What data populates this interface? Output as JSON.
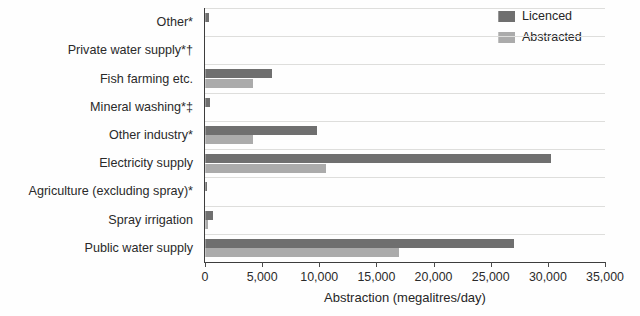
{
  "chart_data": {
    "type": "bar",
    "orientation": "horizontal",
    "title": "",
    "xlabel": "Abstraction (megalitres/day)",
    "ylabel": "",
    "xlim": [
      0,
      35000
    ],
    "xticks": [
      "0",
      "5,000",
      "10,000",
      "15,000",
      "20,000",
      "25,000",
      "30,000",
      "35,000"
    ],
    "xtick_values": [
      0,
      5000,
      10000,
      15000,
      20000,
      25000,
      30000,
      35000
    ],
    "grid": true,
    "legend_position": "top-right",
    "categories": [
      "Other*",
      "Private water supply*†",
      "Fish farming etc.",
      "Mineral washing*‡",
      "Other industry*",
      "Electricity supply",
      "Agriculture (excluding spray)*",
      "Spray irrigation",
      "Public water supply"
    ],
    "series": [
      {
        "name": "Licenced",
        "color": "#6f6f6f",
        "values": [
          350,
          0,
          5900,
          400,
          9800,
          30300,
          150,
          700,
          27000
        ]
      },
      {
        "name": "Abstracted",
        "color": "#ababab",
        "values": [
          0,
          0,
          4200,
          0,
          4200,
          10600,
          0,
          300,
          17000
        ]
      }
    ]
  },
  "legend": {
    "items": [
      {
        "label": "Licenced",
        "color": "#6f6f6f"
      },
      {
        "label": "Abstracted",
        "color": "#ababab"
      }
    ]
  },
  "axis": {
    "x_title": "Abstraction (megalitres/day)"
  }
}
